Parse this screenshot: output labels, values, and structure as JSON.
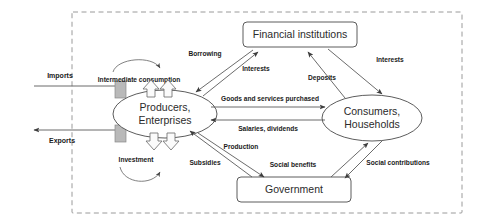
{
  "diagram": {
    "boundary": {
      "name": "national-economy-boundary",
      "style": "dashed"
    },
    "nodes": [
      {
        "id": "producers",
        "label_line1": "Producers,",
        "label_line2": "Enterprises",
        "shape": "ellipse"
      },
      {
        "id": "consumers",
        "label_line1": "Consumers,",
        "label_line2": "Households",
        "shape": "ellipse"
      },
      {
        "id": "financial",
        "label": "Financial institutions",
        "shape": "rounded-rect"
      },
      {
        "id": "government",
        "label": "Government",
        "shape": "rounded-rect"
      }
    ],
    "external_flows": [
      {
        "id": "imports",
        "label": "Imports",
        "direction": "inbound"
      },
      {
        "id": "exports",
        "label": "Exports",
        "direction": "outbound"
      }
    ],
    "internal_flows": [
      {
        "id": "intermediate-consumption",
        "label": "Intermediate consumption",
        "from": "producers",
        "to": "producers"
      },
      {
        "id": "investment",
        "label": "Investment",
        "from": "producers",
        "to": "producers"
      },
      {
        "id": "borrowing",
        "label": "Borrowing",
        "from": "financial",
        "to": "producers"
      },
      {
        "id": "interests-producers",
        "label": "Interests",
        "from": "producers",
        "to": "financial"
      },
      {
        "id": "deposits",
        "label": "Deposits",
        "from": "consumers",
        "to": "financial"
      },
      {
        "id": "interests-consumers",
        "label": "Interests",
        "from": "financial",
        "to": "consumers"
      },
      {
        "id": "goods-and-services-purchased",
        "label": "Goods and services purchased",
        "from": "producers",
        "to": "consumers"
      },
      {
        "id": "salaries-dividends",
        "label": "Salaries, dividends",
        "from": "consumers",
        "to": "producers"
      },
      {
        "id": "production",
        "label": "Production",
        "from": "producers",
        "to": "government"
      },
      {
        "id": "subsidies",
        "label": "Subsidies",
        "from": "government",
        "to": "producers"
      },
      {
        "id": "social-benefits",
        "label": "Social benefits",
        "from": "government",
        "to": "consumers"
      },
      {
        "id": "social-contributions",
        "label": "Social contributions",
        "from": "consumers",
        "to": "government"
      }
    ],
    "colors": {
      "stroke": "#4a4a4a",
      "connector": "#5a5a5a",
      "boundary": "#9a9a9a",
      "bar_fill": "#b9b9b9",
      "text": "#1a1a1a",
      "background": "#ffffff"
    }
  }
}
